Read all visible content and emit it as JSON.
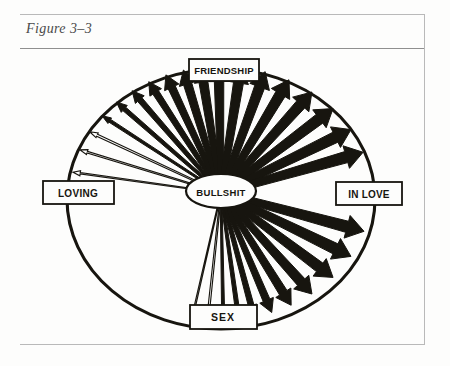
{
  "caption": "Figure 3–3",
  "figure": {
    "center_node": {
      "label": "BULLSHIT"
    },
    "nodes": [
      {
        "id": "friendship",
        "label": "FRIENDSHIP",
        "position": "top"
      },
      {
        "id": "in-love",
        "label": "IN LOVE",
        "position": "right"
      },
      {
        "id": "sex",
        "label": "SEX",
        "position": "bottom"
      },
      {
        "id": "loving",
        "label": "LOVING",
        "position": "left"
      }
    ]
  },
  "chart_data": {
    "type": "radial-arrow-diagram",
    "center": "BULLSHIT",
    "axis_labels": [
      "FRIENDSHIP",
      "IN LOVE",
      "SEX",
      "LOVING"
    ],
    "quadrants": [
      {
        "from": "FRIENDSHIP",
        "to": "IN LOVE",
        "arrows": 11,
        "weight_trend": "thin to thick"
      },
      {
        "from": "IN LOVE",
        "to": "SEX",
        "arrows": 8,
        "weight_trend": "thick"
      },
      {
        "from": "SEX",
        "to": "LOVING",
        "arrows": 11,
        "weight_trend": "thick to thin"
      },
      {
        "from": "LOVING",
        "to": "FRIENDSHIP",
        "arrows": 0,
        "weight_trend": "none"
      }
    ],
    "arrows": [
      {
        "angle_deg": -82,
        "weight": 1.0
      },
      {
        "angle_deg": -73,
        "weight": 1.3
      },
      {
        "angle_deg": -65,
        "weight": 1.8
      },
      {
        "angle_deg": -57,
        "weight": 2.6
      },
      {
        "angle_deg": -49,
        "weight": 3.6
      },
      {
        "angle_deg": -41,
        "weight": 4.6
      },
      {
        "angle_deg": -33,
        "weight": 5.4
      },
      {
        "angle_deg": -25,
        "weight": 6.2
      },
      {
        "angle_deg": -17,
        "weight": 6.8
      },
      {
        "angle_deg": -9,
        "weight": 7.2
      },
      {
        "angle_deg": -1,
        "weight": 7.6
      },
      {
        "angle_deg": 9,
        "weight": 8.0
      },
      {
        "angle_deg": 20,
        "weight": 8.2
      },
      {
        "angle_deg": 31,
        "weight": 8.4
      },
      {
        "angle_deg": 42,
        "weight": 8.6
      },
      {
        "angle_deg": 53,
        "weight": 8.8
      },
      {
        "angle_deg": 64,
        "weight": 9.0
      },
      {
        "angle_deg": 74,
        "weight": 9.2
      },
      {
        "angle_deg": 105,
        "weight": 9.2
      },
      {
        "angle_deg": 116,
        "weight": 9.0
      },
      {
        "angle_deg": 127,
        "weight": 8.6
      },
      {
        "angle_deg": 138,
        "weight": 8.0
      },
      {
        "angle_deg": 148,
        "weight": 7.0
      },
      {
        "angle_deg": 157,
        "weight": 5.8
      },
      {
        "angle_deg": 165,
        "weight": 4.6
      },
      {
        "angle_deg": 172,
        "weight": 3.4
      },
      {
        "angle_deg": 179,
        "weight": 2.4
      },
      {
        "angle_deg": 186,
        "weight": 1.6
      },
      {
        "angle_deg": 193,
        "weight": 1.1
      }
    ]
  },
  "colors": {
    "ink": "#17150f",
    "paper": "#fdfdfc",
    "rule": "#b9b9b9",
    "caption": "#4a4a4a"
  }
}
